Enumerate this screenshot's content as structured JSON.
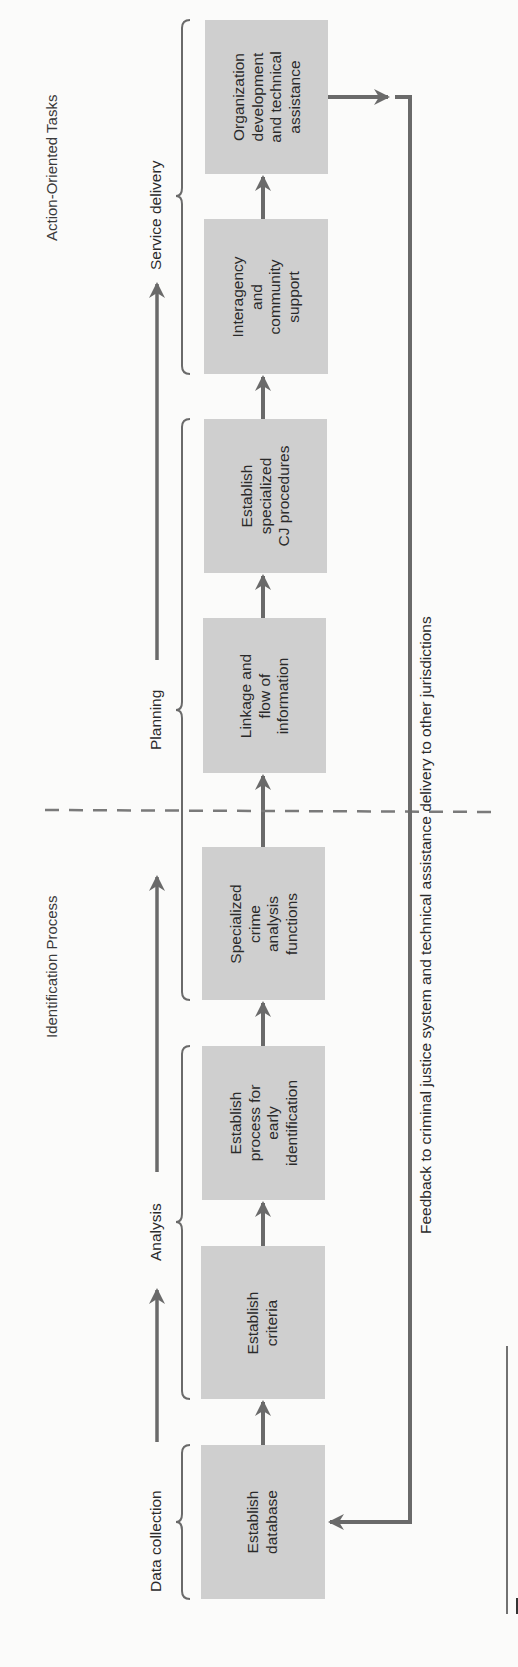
{
  "sections": {
    "identification": "Identification Process",
    "action": "Action-Oriented Tasks"
  },
  "phases": [
    {
      "label": "Data collection"
    },
    {
      "label": "Analysis"
    },
    {
      "label": "Planning"
    },
    {
      "label": "Service delivery"
    }
  ],
  "boxes": [
    {
      "label": "Establish\ndatabase"
    },
    {
      "label": "Establish\ncriteria"
    },
    {
      "label": "Establish\nprocess for\nearly\nidentification"
    },
    {
      "label": "Specialized\ncrime\nanalysis\nfunctions"
    },
    {
      "label": "Linkage and\nflow of\ninformation"
    },
    {
      "label": "Establish\nspecialized\nCJ procedures"
    },
    {
      "label": "Interagency\nand\ncommunity\nsupport"
    },
    {
      "label": "Organization\ndevelopment\nand technical\nassistance"
    }
  ],
  "feedback": {
    "label": "Feedback to criminal justice system and technical assistance delivery to other jurisdictions"
  },
  "colors": {
    "box_fill": "#cfcfcf",
    "arrow": "#6a6a6a",
    "text": "#2a2a2a",
    "background": "#fbfbfa"
  }
}
